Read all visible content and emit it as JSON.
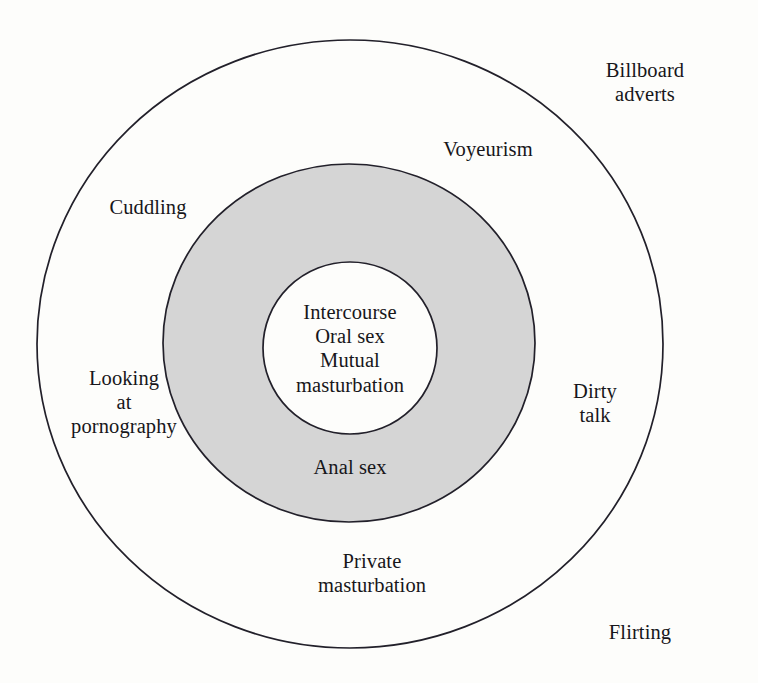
{
  "diagram": {
    "type": "concentric-circles",
    "title": "",
    "background_color": "#fdfdfb",
    "stroke_color": "#22202a",
    "rings": [
      {
        "name": "outer-ring",
        "fill_color": "#fdfdfb",
        "label": "outer boundary"
      },
      {
        "name": "middle-ring",
        "fill_color": "#d5d5d5",
        "label": "shaded middle ring"
      },
      {
        "name": "inner-circle",
        "fill_color": "#fdfdfb",
        "label": "inner core"
      }
    ],
    "labels": {
      "core": "Intercourse\nOral sex\nMutual\nmasturbation",
      "middle_ring": "Anal sex",
      "outer_ring": {
        "cuddling": "Cuddling",
        "pornography": "Looking\nat\npornography",
        "dirty_talk": "Dirty\ntalk",
        "private_masturbation": "Private\nmasturbation"
      },
      "outside": {
        "voyeurism": "Voyeurism",
        "billboard_adverts": "Billboard adverts",
        "flirting": "Flirting"
      }
    }
  }
}
